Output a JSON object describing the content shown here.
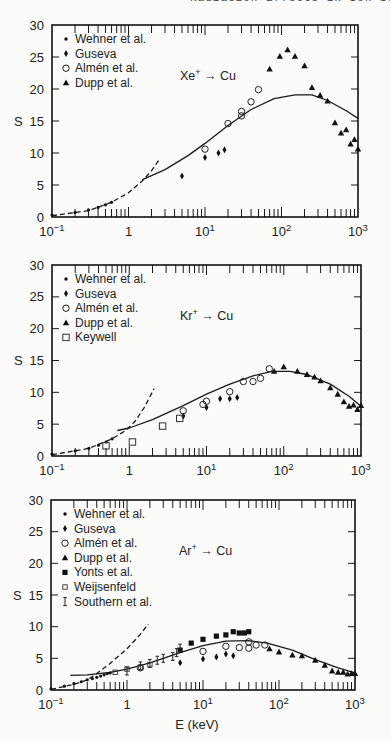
{
  "header_fragment": "Radiation Effects in Ion Irradiated Solids",
  "chart_data": [
    {
      "type": "scatter",
      "title": "Xe+ → Cu",
      "xlabel": "",
      "ylabel": "S",
      "xscale": "log",
      "xlim": [
        0.1,
        1000
      ],
      "ylim": [
        0,
        30
      ],
      "xticks": [
        "10^-1",
        "1",
        "10^1",
        "10^2",
        "10^3"
      ],
      "yticks": [
        0,
        5,
        10,
        15,
        20,
        25,
        30
      ],
      "legend_position": "upper-left",
      "frame": {
        "x0": 52,
        "x1": 358,
        "ytop": 25,
        "ybot": 217
      },
      "series": [
        {
          "name": "Wehner et al.",
          "marker": "dot",
          "points": [
            [
              0.1,
              0.3
            ],
            [
              0.2,
              0.7
            ],
            [
              0.3,
              1.1
            ],
            [
              0.4,
              1.5
            ],
            [
              0.5,
              1.9
            ],
            [
              0.6,
              2.3
            ]
          ]
        },
        {
          "name": "Guseva",
          "marker": "diamond",
          "points": [
            [
              5,
              6.4
            ],
            [
              10,
              9.3
            ],
            [
              15,
              10
            ],
            [
              18,
              10.5
            ]
          ]
        },
        {
          "name": "Almén et al.",
          "marker": "circle-open",
          "points": [
            [
              10,
              10.6
            ],
            [
              20,
              14.6
            ],
            [
              30,
              16.5
            ],
            [
              30,
              15.8
            ],
            [
              40,
              18
            ],
            [
              50,
              19.9
            ]
          ]
        },
        {
          "name": "Dupp et al.",
          "marker": "triangle",
          "points": [
            [
              70,
              23.1
            ],
            [
              95,
              25.1
            ],
            [
              120,
              26.1
            ],
            [
              150,
              25.1
            ],
            [
              200,
              23.6
            ],
            [
              250,
              20.2
            ],
            [
              320,
              19
            ],
            [
              400,
              18.1
            ],
            [
              500,
              14.7
            ],
            [
              600,
              13.1
            ],
            [
              700,
              13.6
            ],
            [
              800,
              11.4
            ],
            [
              900,
              12.1
            ],
            [
              1000,
              10.6
            ]
          ]
        }
      ],
      "curves": [
        {
          "name": "theory-low-energy",
          "style": "dashed",
          "points": [
            [
              0.1,
              0.2
            ],
            [
              0.3,
              1.0
            ],
            [
              0.6,
              2.3
            ],
            [
              1.0,
              3.8
            ],
            [
              1.5,
              5.6
            ],
            [
              2.0,
              7.2
            ],
            [
              2.5,
              8.9
            ]
          ]
        },
        {
          "name": "theory",
          "style": "solid",
          "points": [
            [
              1.5,
              5.8
            ],
            [
              3,
              7.4
            ],
            [
              6,
              9.6
            ],
            [
              10,
              11.5
            ],
            [
              20,
              14.3
            ],
            [
              40,
              16.8
            ],
            [
              80,
              18.5
            ],
            [
              150,
              19.1
            ],
            [
              250,
              19.1
            ],
            [
              400,
              18.2
            ],
            [
              700,
              16.6
            ],
            [
              1000,
              15.4
            ]
          ]
        }
      ]
    },
    {
      "type": "scatter",
      "title": "Kr+ → Cu",
      "xlabel": "",
      "ylabel": "S",
      "xscale": "log",
      "xlim": [
        0.1,
        1000
      ],
      "ylim": [
        0,
        30
      ],
      "xticks": [
        "10^-1",
        "1",
        "10^1",
        "10^2",
        "10^3"
      ],
      "yticks": [
        0,
        5,
        10,
        15,
        20,
        25,
        30
      ],
      "legend_position": "upper-left",
      "frame": {
        "x0": 52,
        "x1": 361,
        "ytop": 265,
        "ybot": 456
      },
      "series": [
        {
          "name": "Wehner et al.",
          "marker": "dot",
          "points": [
            [
              0.1,
              0.3
            ],
            [
              0.2,
              0.8
            ],
            [
              0.3,
              1.2
            ],
            [
              0.4,
              1.7
            ],
            [
              0.5,
              2.2
            ],
            [
              0.6,
              2.7
            ]
          ]
        },
        {
          "name": "Guseva",
          "marker": "diamond",
          "points": [
            [
              5,
              6.3
            ],
            [
              10,
              7.6
            ],
            [
              15,
              9
            ],
            [
              20,
              9
            ],
            [
              25,
              9.2
            ]
          ]
        },
        {
          "name": "Almén et al.",
          "marker": "circle-open",
          "points": [
            [
              5,
              7.1
            ],
            [
              9,
              8.1
            ],
            [
              10,
              8.6
            ],
            [
              20,
              10.1
            ],
            [
              30,
              11.7
            ],
            [
              40,
              11.7
            ],
            [
              50,
              12.2
            ],
            [
              65,
              13.7
            ]
          ]
        },
        {
          "name": "Dupp et al.",
          "marker": "triangle",
          "points": [
            [
              75,
              13.3
            ],
            [
              100,
              14
            ],
            [
              150,
              13.3
            ],
            [
              200,
              12.8
            ],
            [
              250,
              12.4
            ],
            [
              300,
              11.8
            ],
            [
              400,
              10.7
            ],
            [
              500,
              9.7
            ],
            [
              600,
              8.5
            ],
            [
              700,
              7.8
            ],
            [
              800,
              8
            ],
            [
              900,
              7.3
            ],
            [
              1000,
              7.9
            ]
          ]
        },
        {
          "name": "Keywell",
          "marker": "square-open",
          "points": [
            [
              0.5,
              1.6
            ],
            [
              1.1,
              2.2
            ],
            [
              2.7,
              4.7
            ],
            [
              4.5,
              5.9
            ]
          ]
        }
      ],
      "curves": [
        {
          "name": "theory-low-energy",
          "style": "dashed",
          "points": [
            [
              0.1,
              0.2
            ],
            [
              0.3,
              1.2
            ],
            [
              0.6,
              2.7
            ],
            [
              0.9,
              4.0
            ],
            [
              1.2,
              5.5
            ],
            [
              1.6,
              7.8
            ],
            [
              2.1,
              10.6
            ]
          ]
        },
        {
          "name": "theory",
          "style": "solid",
          "points": [
            [
              0.7,
              4.0
            ],
            [
              1,
              4.4
            ],
            [
              2,
              5.7
            ],
            [
              5,
              7.9
            ],
            [
              10,
              9.7
            ],
            [
              20,
              11.3
            ],
            [
              40,
              12.6
            ],
            [
              70,
              13.3
            ],
            [
              120,
              13.3
            ],
            [
              200,
              12.8
            ],
            [
              400,
              11.3
            ],
            [
              700,
              9.4
            ],
            [
              1000,
              7.8
            ]
          ]
        }
      ]
    },
    {
      "type": "scatter",
      "title": "Ar+ → Cu",
      "xlabel": "E (keV)",
      "ylabel": "S",
      "xscale": "log",
      "xlim": [
        0.1,
        1000
      ],
      "ylim": [
        0,
        30
      ],
      "xticks": [
        "10^-1",
        "1",
        "10^1",
        "10^2",
        "10^3"
      ],
      "yticks": [
        0,
        5,
        10,
        15,
        20,
        25,
        30
      ],
      "legend_position": "upper-left",
      "frame": {
        "x0": 51,
        "x1": 355,
        "ytop": 500,
        "ybot": 690
      },
      "series": [
        {
          "name": "Wehner et al.",
          "marker": "dot",
          "points": [
            [
              0.1,
              0.2
            ],
            [
              0.15,
              0.6
            ],
            [
              0.2,
              1.0
            ],
            [
              0.25,
              1.3
            ],
            [
              0.3,
              1.6
            ],
            [
              0.35,
              1.8
            ],
            [
              0.4,
              2.0
            ],
            [
              0.45,
              2.2
            ],
            [
              0.5,
              2.4
            ],
            [
              0.55,
              2.6
            ],
            [
              0.6,
              2.7
            ]
          ]
        },
        {
          "name": "Guseva",
          "marker": "diamond",
          "points": [
            [
              5,
              4.3
            ],
            [
              10,
              4.9
            ],
            [
              15,
              5.2
            ],
            [
              20,
              5.7
            ],
            [
              25,
              5.4
            ]
          ]
        },
        {
          "name": "Almén et al.",
          "marker": "circle-open",
          "points": [
            [
              1.5,
              3.5
            ],
            [
              10,
              6.1
            ],
            [
              20,
              6.9
            ],
            [
              30,
              6.7
            ],
            [
              40,
              7.6
            ],
            [
              40,
              6.6
            ],
            [
              50,
              7.1
            ],
            [
              65,
              7.1
            ]
          ]
        },
        {
          "name": "Dupp et al.",
          "marker": "triangle",
          "points": [
            [
              75,
              6.5
            ],
            [
              100,
              6.0
            ],
            [
              150,
              5.5
            ],
            [
              200,
              5.4
            ],
            [
              300,
              4.7
            ],
            [
              400,
              3.9
            ],
            [
              500,
              3.0
            ],
            [
              600,
              2.8
            ],
            [
              700,
              2.8
            ],
            [
              800,
              2.5
            ],
            [
              900,
              2.6
            ],
            [
              1000,
              2.6
            ]
          ]
        },
        {
          "name": "Yonts et al.",
          "marker": "square-filled",
          "points": [
            [
              5,
              6.3
            ],
            [
              7,
              7.4
            ],
            [
              10,
              8.0
            ],
            [
              15,
              8.5
            ],
            [
              20,
              8.7
            ],
            [
              25,
              9.2
            ],
            [
              30,
              9.0
            ],
            [
              35,
              9.0
            ],
            [
              40,
              9.2
            ]
          ]
        },
        {
          "name": "Weijsenfeld",
          "marker": "square-open-small",
          "points": [
            [
              0.7,
              2.8
            ],
            [
              1,
              3.3
            ],
            [
              1.5,
              3.6
            ],
            [
              2,
              4.0
            ]
          ]
        },
        {
          "name": "Southern et al.",
          "marker": "errorbar",
          "points": [
            [
              1,
              3.0
            ],
            [
              1.5,
              3.8
            ],
            [
              2,
              4.2
            ],
            [
              2.5,
              4.7
            ],
            [
              3,
              5.0
            ],
            [
              4,
              5.3
            ],
            [
              4.5,
              5.9
            ],
            [
              5,
              6.6
            ]
          ]
        }
      ],
      "curves": [
        {
          "name": "theory-low-energy",
          "style": "dashed",
          "points": [
            [
              0.1,
              0.1
            ],
            [
              0.2,
              0.9
            ],
            [
              0.3,
              1.6
            ],
            [
              0.4,
              2.6
            ],
            [
              0.6,
              4.2
            ],
            [
              1.0,
              6.5
            ],
            [
              1.5,
              8.8
            ],
            [
              1.9,
              10.4
            ]
          ]
        },
        {
          "name": "theory",
          "style": "solid",
          "points": [
            [
              0.18,
              2.3
            ],
            [
              0.3,
              2.4
            ],
            [
              0.6,
              2.8
            ],
            [
              1,
              3.3
            ],
            [
              2,
              4.3
            ],
            [
              5,
              5.9
            ],
            [
              10,
              7.0
            ],
            [
              20,
              7.7
            ],
            [
              40,
              7.8
            ],
            [
              70,
              7.4
            ],
            [
              150,
              6.3
            ],
            [
              300,
              4.8
            ],
            [
              600,
              3.5
            ],
            [
              1000,
              2.7
            ]
          ]
        }
      ]
    }
  ]
}
